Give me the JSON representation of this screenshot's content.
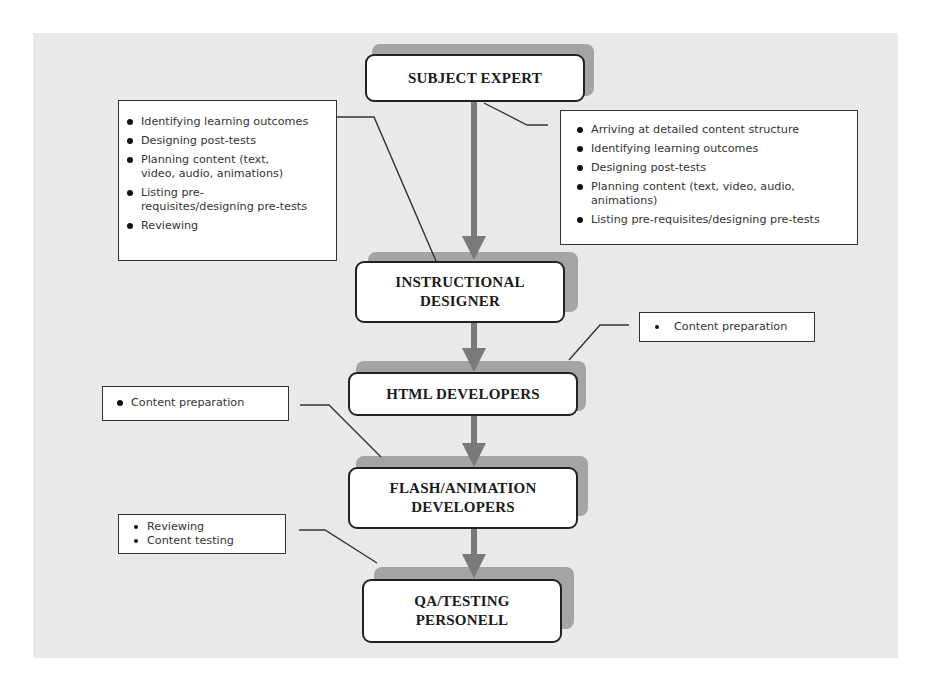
{
  "nodes": {
    "subject_expert": "SUBJECT EXPERT",
    "instructional_designer": "INSTRUCTIONAL DESIGNER",
    "html_developers": "HTML DEVELOPERS",
    "flash_animation_developers": "FLASH/ANIMATION DEVELOPERS",
    "qa_testing_personell": "QA/TESTING PERSONELL"
  },
  "callouts": {
    "instructional_designer_tasks": [
      "Identifying learning outcomes",
      "Designing post-tests",
      "Planning content (text, video, audio, animations)",
      "Listing pre-requisites/designing pre-tests",
      "Reviewing"
    ],
    "subject_expert_tasks": [
      "Arriving at detailed content structure",
      "Identifying learning outcomes",
      "Designing post-tests",
      "Planning content (text, video, audio, animations)",
      "Listing pre-requisites/designing pre-tests"
    ],
    "html_developers_tasks": [
      "Content preparation"
    ],
    "flash_developers_tasks": [
      "Content preparation"
    ],
    "qa_tasks": [
      "Reviewing",
      "Content testing"
    ]
  },
  "colors": {
    "background": "#e9e9e9",
    "arrow": "#7a7a7a",
    "shadow": "#a4a4a4",
    "border": "#222222"
  }
}
